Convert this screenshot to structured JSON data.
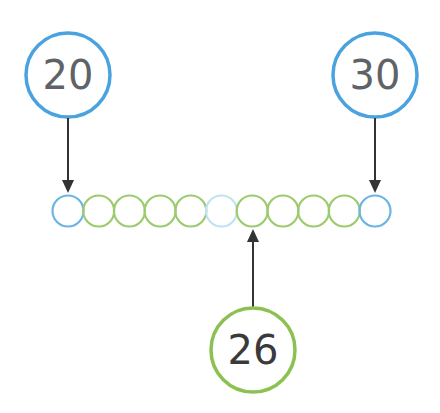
{
  "diagram": {
    "type": "number-line-beads",
    "start": {
      "label": "20",
      "color": "#4aa3df"
    },
    "end": {
      "label": "30",
      "color": "#4aa3df"
    },
    "marker": {
      "label": "26",
      "color": "#8cc152",
      "bead_index": 6
    },
    "beads": [
      {
        "value": 20,
        "color": "#6cb4e4"
      },
      {
        "value": 21,
        "color": "#9ccb6e"
      },
      {
        "value": 22,
        "color": "#9ccb6e"
      },
      {
        "value": 23,
        "color": "#9ccb6e"
      },
      {
        "value": 24,
        "color": "#9ccb6e"
      },
      {
        "value": 25,
        "color": "#bfe3f2"
      },
      {
        "value": 26,
        "color": "#9ccb6e"
      },
      {
        "value": 27,
        "color": "#9ccb6e"
      },
      {
        "value": 28,
        "color": "#9ccb6e"
      },
      {
        "value": 29,
        "color": "#9ccb6e"
      },
      {
        "value": 30,
        "color": "#6cb4e4"
      }
    ],
    "arrow_color": "#333333"
  }
}
